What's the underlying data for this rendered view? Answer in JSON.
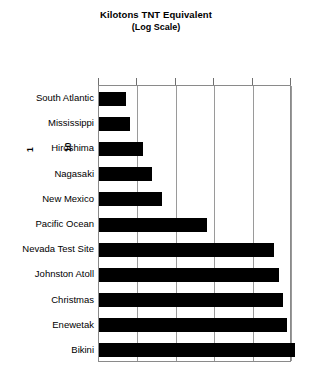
{
  "chart_data": {
    "type": "bar",
    "orientation": "horizontal",
    "title": "Kilotons TNT Equivalent",
    "subtitle": "(Log Scale)",
    "xlabel": "",
    "ylabel": "",
    "scale": "log",
    "grid": true,
    "legend": null,
    "xlim": [
      1,
      100000
    ],
    "xticks": [
      1,
      10,
      100,
      1000,
      10000,
      100000
    ],
    "xtick_labels": [
      "1",
      "10",
      "100",
      "1,000",
      "10,000",
      "100,000"
    ],
    "categories": [
      "South Atlantic",
      "Mississippi",
      "Hiroshima",
      "Nagasaki",
      "New Mexico",
      "Pacific Ocean",
      "Nevada Test Site",
      "Johnston Atoll",
      "Christmas",
      "Enewetak",
      "Bikini"
    ],
    "values": [
      5,
      6.5,
      14,
      24,
      45,
      640,
      37000,
      48000,
      62000,
      80000,
      130000
    ],
    "bar_color": "#000000"
  },
  "colors": {
    "bar": "#000000",
    "grid": "#9a9a9a",
    "frame": "#8a8a8a",
    "text": "#000000",
    "background": "#ffffff"
  }
}
